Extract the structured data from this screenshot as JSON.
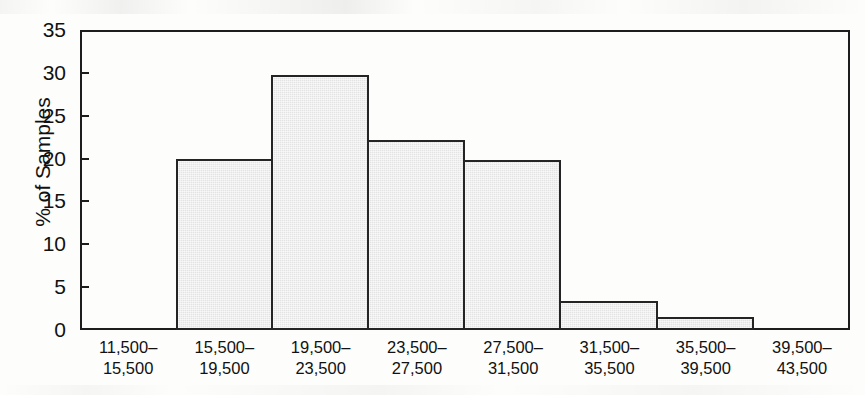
{
  "chart_data": {
    "type": "bar",
    "title": "",
    "xlabel": "",
    "ylabel": "% of Samples",
    "ylim": [
      0,
      35
    ],
    "yticks": [
      0,
      5,
      10,
      15,
      20,
      25,
      30,
      35
    ],
    "grid": false,
    "legend": null,
    "bin_width": 4000,
    "categories": [
      "11,500–\n15,500",
      "15,500–\n19,500",
      "19,500–\n23,500",
      "23,500–\n27,500",
      "27,500–\n31,500",
      "31,500–\n35,500",
      "35,500–\n39,500",
      "39,500–\n43,500"
    ],
    "category_lines": [
      [
        "11,500–",
        "15,500"
      ],
      [
        "15,500–",
        "19,500"
      ],
      [
        "19,500–",
        "23,500"
      ],
      [
        "23,500–",
        "27,500"
      ],
      [
        "27,500–",
        "31,500"
      ],
      [
        "31,500–",
        "35,500"
      ],
      [
        "35,500–",
        "39,500"
      ],
      [
        "39,500–",
        "43,500"
      ]
    ],
    "values": [
      0,
      20.0,
      29.8,
      22.2,
      19.8,
      3.4,
      1.5,
      0
    ],
    "bar_fill_color": "#e3e3e3",
    "bar_border_color": "#242424",
    "axis_color": "#1d1d1d"
  }
}
